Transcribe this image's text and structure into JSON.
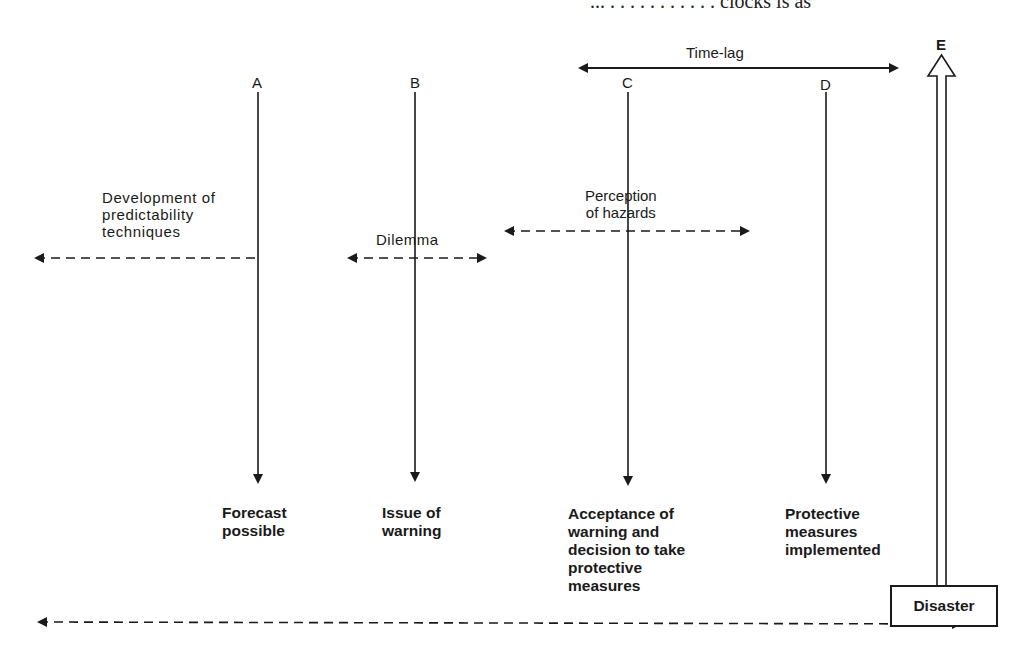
{
  "page_header_fragment": "... . . . . . . . . . . . clocks is as",
  "diagram": {
    "stages": [
      {
        "letter": "A",
        "outcome": [
          "Forecast",
          "possible"
        ]
      },
      {
        "letter": "B",
        "outcome": [
          "Issue of",
          "warning"
        ]
      },
      {
        "letter": "C",
        "outcome": [
          "Acceptance of",
          "warning and",
          "decision to take",
          "protective",
          "measures"
        ]
      },
      {
        "letter": "D",
        "outcome": [
          "Protective",
          "measures",
          "implemented"
        ]
      },
      {
        "letter": "E",
        "outcome": [
          "Disaster"
        ]
      }
    ],
    "spans": {
      "time_lag": "Time-lag",
      "development": [
        "Development of",
        "predictability",
        "techniques"
      ],
      "dilemma": "Dilemma",
      "perception": [
        "Perception",
        "of hazards"
      ]
    }
  },
  "colors": {
    "ink": "#1a1a1a",
    "background": "#ffffff"
  }
}
